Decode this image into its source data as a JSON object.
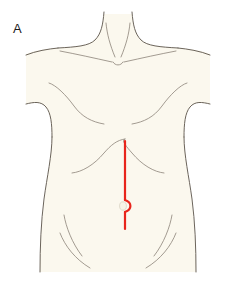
{
  "figure": {
    "panel_label": "A",
    "caption_visible": false,
    "background_color": "#ffffff"
  },
  "illustration": {
    "subject": "anterior-female-torso",
    "view": "frontal",
    "skin_fill_color": "#fbf8ee",
    "outline_color": "#5a5248",
    "outline_width": 0.9,
    "inner_line_color": "#837a6d",
    "inner_line_width": 0.8,
    "body_parts": [
      {
        "name": "neck",
        "label": "neck"
      },
      {
        "name": "left-shoulder",
        "label": "left shoulder"
      },
      {
        "name": "right-shoulder",
        "label": "right shoulder"
      },
      {
        "name": "sternal-notch",
        "label": "sternal notch"
      },
      {
        "name": "left-clavicle",
        "label": "left clavicle"
      },
      {
        "name": "right-clavicle",
        "label": "right clavicle"
      },
      {
        "name": "left-axillary-fold",
        "label": "left axillary fold"
      },
      {
        "name": "right-axillary-fold",
        "label": "right axillary fold"
      },
      {
        "name": "costal-margin",
        "label": "costal margin"
      },
      {
        "name": "left-flank",
        "label": "left flank"
      },
      {
        "name": "right-flank",
        "label": "right flank"
      },
      {
        "name": "umbilicus",
        "label": "umbilicus"
      },
      {
        "name": "left-inguinal-crease",
        "label": "left inguinal crease"
      },
      {
        "name": "right-inguinal-crease",
        "label": "right inguinal crease"
      }
    ]
  },
  "incision_marking": {
    "name": "midline-laparotomy-incision",
    "label": "midline incision",
    "color": "#e8251c",
    "stroke_width": 2.2,
    "orientation": "vertical-midline",
    "center_x": 125,
    "top_y": 141,
    "bottom_y": 229,
    "umbilicus_detour": {
      "side": "right",
      "center_y": 206,
      "radius": 6
    }
  }
}
